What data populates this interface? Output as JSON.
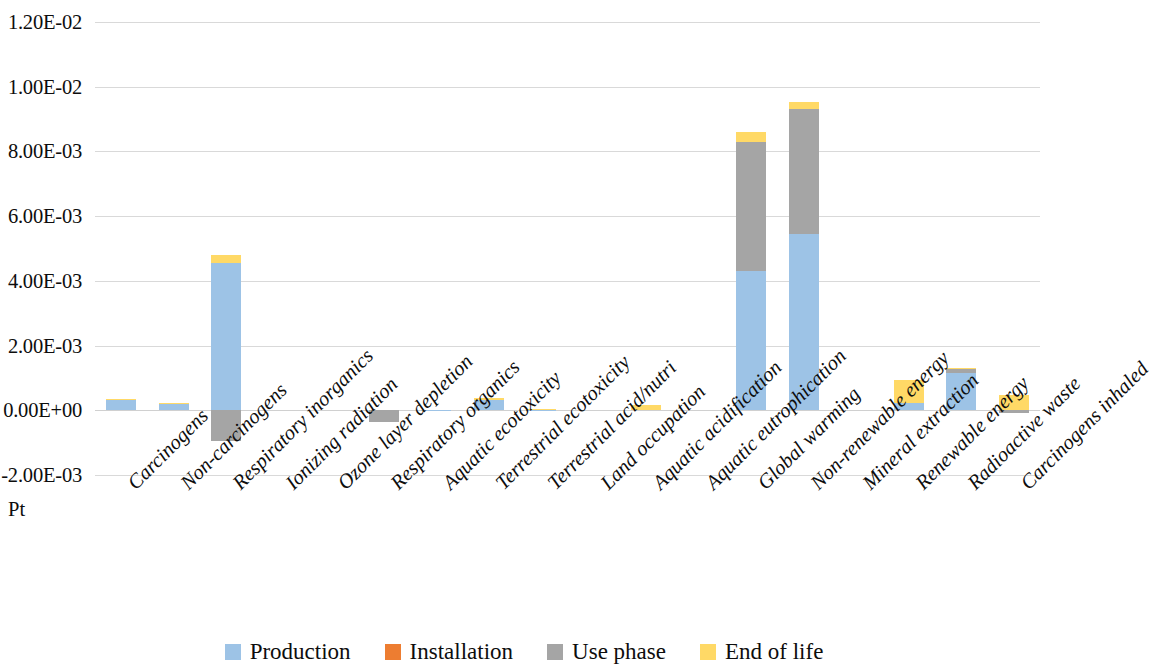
{
  "chart_data": {
    "type": "bar",
    "subtype": "stacked",
    "title": "",
    "xlabel": "",
    "ylabel": "Pt",
    "unit_label": "Pt",
    "ylim": [
      -0.002,
      0.012
    ],
    "ytick_values": [
      0.012,
      0.01,
      0.008,
      0.006,
      0.004,
      0.002,
      0.0,
      -0.002
    ],
    "ytick_labels": [
      "1.20E-02",
      "1.00E-02",
      "8.00E-03",
      "6.00E-03",
      "4.00E-03",
      "2.00E-03",
      "0.00E+00",
      "-2.00E-03"
    ],
    "grid": true,
    "legend_position": "bottom",
    "categories": [
      "Carcinogens",
      "Non-carcinogens",
      "Respiratory inorganics",
      "Ionizing radiation",
      "Ozone layer depletion",
      "Respiratory organics",
      "Aquatic ecotoxicity",
      "Terrestrial ecotoxicity",
      "Terrestrial acid/nutri",
      "Land occupation",
      "Aquatic acidification",
      "Aquatic eutrophication",
      "Global warming",
      "Non-renewable energy",
      "Mineral extraction",
      "Renewable energy",
      "Radioactive waste",
      "Carcinogens inhaled"
    ],
    "series": [
      {
        "name": "Production",
        "color": "#9DC3E6",
        "values": [
          0.00032,
          0.00021,
          0.00455,
          0.0,
          0.0,
          0.0,
          1.5e-05,
          0.00031,
          2e-05,
          0.0,
          1e-05,
          0.0,
          0.0043,
          0.00545,
          0.0,
          0.00024,
          0.00115,
          0.0
        ]
      },
      {
        "name": "Installation",
        "color": "#ED7D31",
        "values": [
          0.0,
          0.0,
          0.0,
          0.0,
          0.0,
          0.0,
          0.0,
          0.0,
          0.0,
          0.0,
          0.0,
          0.0,
          0.0,
          0.0,
          0.0,
          0.0,
          0.0,
          0.0
        ]
      },
      {
        "name": "Use phase",
        "color": "#A5A5A5",
        "values": [
          0.0,
          0.0,
          -0.00095,
          0.0,
          0.0,
          -0.00035,
          0.0,
          0.0,
          0.0,
          0.0,
          0.0,
          0.0,
          0.004,
          0.00385,
          0.0,
          0.0,
          0.00015,
          -8e-05
        ]
      },
      {
        "name": "End of life",
        "color": "#FFD966",
        "values": [
          4e-05,
          3e-05,
          0.00026,
          0.0,
          0.0,
          0.0,
          5e-06,
          6e-05,
          3e-05,
          0.0,
          0.00017,
          0.0,
          0.0003,
          0.00022,
          0.0,
          0.00069,
          2e-05,
          0.00046
        ]
      }
    ]
  },
  "legend": {
    "items": [
      {
        "label": "Production",
        "color": "#9DC3E6"
      },
      {
        "label": "Installation",
        "color": "#ED7D31"
      },
      {
        "label": "Use phase",
        "color": "#A5A5A5"
      },
      {
        "label": "End of life",
        "color": "#FFD966"
      }
    ]
  }
}
